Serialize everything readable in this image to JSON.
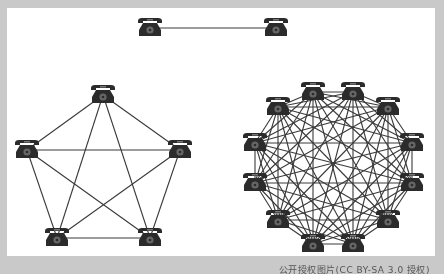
{
  "figure": {
    "background": "#c9c9c9",
    "panel_color": "#ffffff",
    "line_color": "#3a3a3a",
    "phone_color": "#2b2b2b",
    "caption": "公开授权图片(CC BY-SA 3.0 授权)"
  },
  "networks": [
    {
      "name": "two-phone-network",
      "nodes": [
        [
          150,
          28
        ],
        [
          276,
          28
        ]
      ],
      "complete_graph": true,
      "edges_count": 1
    },
    {
      "name": "five-phone-network",
      "nodes": [
        [
          103,
          95
        ],
        [
          180,
          150
        ],
        [
          150,
          238
        ],
        [
          57,
          238
        ],
        [
          27,
          150
        ]
      ],
      "complete_graph": true,
      "edges_count": 10
    },
    {
      "name": "twelve-phone-network",
      "nodes": [
        [
          313,
          92
        ],
        [
          353,
          92
        ],
        [
          388,
          107
        ],
        [
          412,
          143
        ],
        [
          412,
          183
        ],
        [
          388,
          220
        ],
        [
          353,
          244
        ],
        [
          313,
          244
        ],
        [
          278,
          220
        ],
        [
          255,
          183
        ],
        [
          255,
          143
        ],
        [
          278,
          107
        ]
      ],
      "complete_graph": true,
      "edges_count": 66
    }
  ]
}
